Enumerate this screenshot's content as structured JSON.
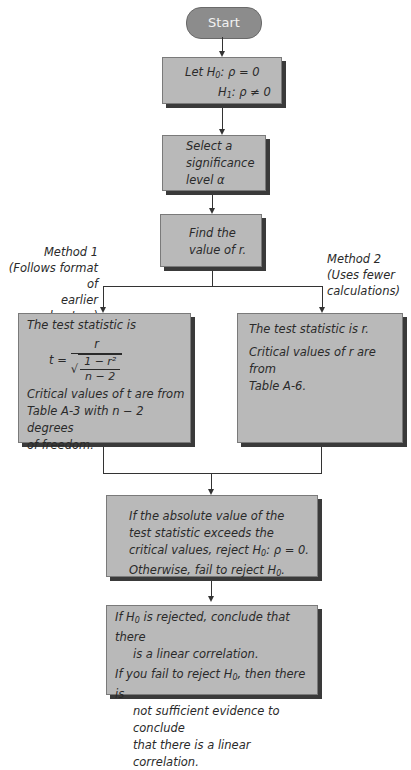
{
  "diagram": {
    "type": "flowchart",
    "start": {
      "label": "Start"
    },
    "hypotheses": {
      "line1_prefix": "Let H",
      "line1_sub": "0",
      "line1_rest": ": ρ = 0",
      "line2_prefix": "H",
      "line2_sub": "1",
      "line2_rest": ": ρ ≠ 0"
    },
    "significance": {
      "line1": "Select a",
      "line2": "significance",
      "line3": "level α"
    },
    "find_r": {
      "line1": "Find the",
      "line2": "value of r."
    },
    "method1_label": {
      "line1": "Method 1",
      "line2": "(Follows format of",
      "line3": "earlier chapters)"
    },
    "method2_label": {
      "line1": "Method 2",
      "line2": "(Uses fewer",
      "line3": "calculations)"
    },
    "method1_box": {
      "intro": "The test statistic is",
      "formula_lhs": "t =",
      "formula_num": "r",
      "formula_sqrt_num": "1 − r²",
      "formula_sqrt_den": "n − 2",
      "crit1": "Critical values of t are from",
      "crit2": "Table A-3 with n − 2 degrees",
      "crit3": "of freedom."
    },
    "method2_box": {
      "intro": "The test statistic is r.",
      "crit1": "Critical values of r are from",
      "crit2": "Table A-6."
    },
    "decision_box": {
      "line1": "If the absolute value of the",
      "line2": "test statistic exceeds the",
      "line3_prefix": "critical values, reject H",
      "line3_sub": "0",
      "line3_rest": ": ρ = 0.",
      "line4_prefix": "Otherwise, fail to reject H",
      "line4_sub": "0",
      "line4_rest": "."
    },
    "conclusion_box": {
      "line1_prefix": "If H",
      "line1_sub": "0",
      "line1_rest": " is rejected, conclude that there",
      "line2": "is a linear correlation.",
      "line3_prefix": "If you fail to reject H",
      "line3_sub": "0",
      "line3_rest": ", then there is",
      "line4": "not sufficient evidence to conclude",
      "line5": "that there is a linear correlation."
    },
    "colors": {
      "box_fill": "#b9b9b9",
      "box_shadow": "#3a3a3a",
      "start_fill": "#8c8c8c",
      "start_text": "#f2f2f2",
      "connector": "#333333"
    }
  }
}
